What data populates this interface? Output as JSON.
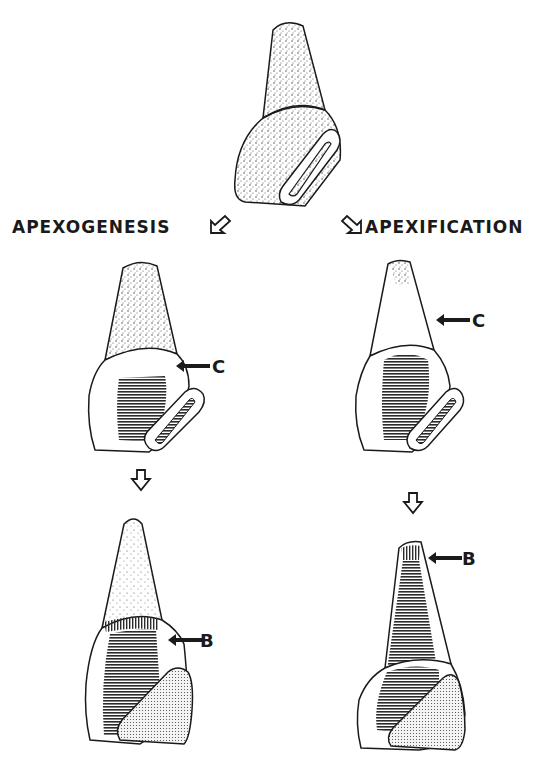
{
  "diagram": {
    "headings": {
      "left": "APEXOGENESIS",
      "right": "APEXIFICATION"
    },
    "markers": {
      "c_left": "C",
      "c_right": "C",
      "b_left": "B",
      "b_right": "B"
    },
    "icons": {
      "left_heading_arrow": "outline-arrow-down-left-icon",
      "right_heading_arrow": "outline-arrow-down-right-icon",
      "left_flow_arrow": "outline-arrow-down-icon",
      "right_flow_arrow": "outline-arrow-down-icon",
      "label_pointer": "solid-arrow-left-icon"
    },
    "colors": {
      "ink": "#1a1a1a",
      "hatch": "#2b2b2b",
      "background": "#ffffff"
    }
  }
}
